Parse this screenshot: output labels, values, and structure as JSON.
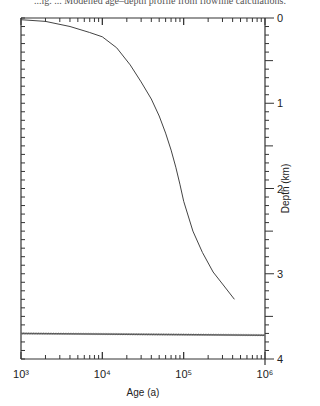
{
  "caption": "...ig. ... Modelled age–depth profile from flowline calculations.",
  "chart_data": {
    "type": "line",
    "title": "",
    "xlabel": "Age (a)",
    "ylabel": "Depth (km)",
    "xscale": "log",
    "xlim": [
      1000,
      1000000
    ],
    "ylim": [
      4,
      0
    ],
    "y_axis_position": "right",
    "x_tick_labels": [
      "10³",
      "10⁴",
      "10⁵",
      "10⁶"
    ],
    "y_tick_labels": [
      "0",
      "1",
      "2",
      "3",
      "4"
    ],
    "grid": false,
    "series": [
      {
        "name": "age-depth curve",
        "x": [
          1000,
          2000,
          4000,
          7000,
          10000,
          15000,
          22000,
          30000,
          40000,
          50000,
          60000,
          70000,
          80000,
          90000,
          100000,
          130000,
          170000,
          230000,
          300000,
          420000
        ],
        "y": [
          0.02,
          0.04,
          0.1,
          0.17,
          0.22,
          0.35,
          0.55,
          0.75,
          0.95,
          1.15,
          1.35,
          1.55,
          1.75,
          1.95,
          2.15,
          2.5,
          2.75,
          2.98,
          3.12,
          3.3
        ]
      },
      {
        "name": "horizontal band (bedrock/base)",
        "x": [
          1000,
          1000000
        ],
        "y": [
          3.7,
          3.72
        ]
      }
    ]
  }
}
